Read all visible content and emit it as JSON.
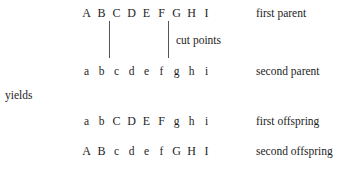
{
  "diagram": {
    "yields_text": "yields",
    "cut_points_label": "cut points",
    "rows": [
      {
        "id": "first-parent",
        "label": "first parent",
        "genes": [
          "A",
          "B",
          "C",
          "D",
          "E",
          "F",
          "G",
          "H",
          "I"
        ],
        "case": [
          "upper",
          "upper",
          "upper",
          "upper",
          "upper",
          "upper",
          "upper",
          "upper",
          "upper"
        ]
      },
      {
        "id": "second-parent",
        "label": "second parent",
        "genes": [
          "a",
          "b",
          "c",
          "d",
          "e",
          "f",
          "g",
          "h",
          "i"
        ],
        "case": [
          "lower",
          "lower",
          "lower",
          "lower",
          "lower",
          "lower",
          "lower",
          "lower",
          "lower"
        ]
      },
      {
        "id": "first-offspring",
        "label": "first offspring",
        "genes": [
          "a",
          "b",
          "C",
          "D",
          "E",
          "F",
          "g",
          "h",
          "i"
        ],
        "case": [
          "lower",
          "lower",
          "upper",
          "upper",
          "upper",
          "upper",
          "lower",
          "lower",
          "lower"
        ]
      },
      {
        "id": "second-offspring",
        "label": "second offspring",
        "genes": [
          "A",
          "B",
          "c",
          "d",
          "e",
          "f",
          "G",
          "H",
          "I"
        ],
        "case": [
          "upper",
          "upper",
          "lower",
          "lower",
          "lower",
          "lower",
          "upper",
          "upper",
          "upper"
        ]
      }
    ],
    "cut_points": [
      {
        "id": "cut-point-1",
        "after_gene_index": 2
      },
      {
        "id": "cut-point-2",
        "after_gene_index": 6
      }
    ],
    "colors": {
      "text": "#1d1d1d",
      "rule": "#555555",
      "background": "#ffffff"
    }
  }
}
